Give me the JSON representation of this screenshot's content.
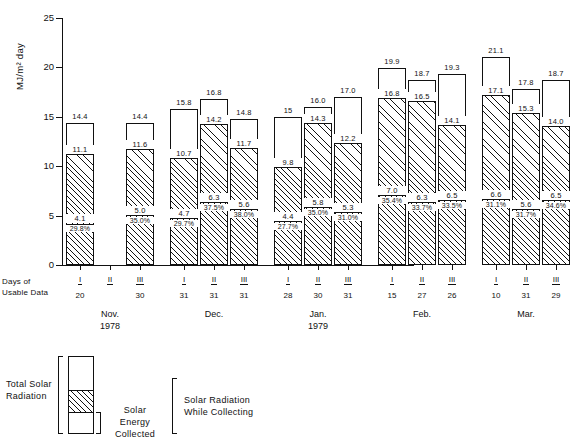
{
  "chart_data": {
    "type": "bar",
    "title": "",
    "xlabel": "",
    "ylabel": "MJ/m² day",
    "ylim": [
      0,
      25
    ],
    "yticks": [
      0,
      5,
      10,
      15,
      20,
      25
    ],
    "ytick_labels": [
      "0",
      "5",
      "10",
      "15",
      "20",
      "25"
    ],
    "grid": false,
    "legend_position": "below-left",
    "stack_note": "Each bar is stacked: dotted = Solar Energy Collected, hatched top edge = Solar Radiation While Collecting, full bar = Total Solar Radiation",
    "groups": [
      {
        "month": "Nov.",
        "year": "1978",
        "bars": [
          {
            "roman": "I",
            "days": "20",
            "total": 14.4,
            "collecting": 11.1,
            "collected": 4.1,
            "percent": "29.8%"
          },
          {
            "roman": "II",
            "days": "",
            "total": null,
            "collecting": null,
            "collected": null,
            "percent": ""
          },
          {
            "roman": "III",
            "days": "30",
            "total": 14.4,
            "collecting": 11.6,
            "collected": 5.0,
            "percent": "35.0%"
          }
        ]
      },
      {
        "month": "Dec.",
        "year": "",
        "bars": [
          {
            "roman": "I",
            "days": "31",
            "total": 15.8,
            "collecting": 10.7,
            "collected": 4.7,
            "percent": "29.7%"
          },
          {
            "roman": "II",
            "days": "31",
            "total": 16.8,
            "collecting": 14.2,
            "collected": 6.3,
            "percent": "37.5%"
          },
          {
            "roman": "III",
            "days": "31",
            "total": 14.8,
            "collecting": 11.7,
            "collected": 5.6,
            "percent": "38.0%"
          }
        ]
      },
      {
        "month": "Jan.",
        "year": "1979",
        "bars": [
          {
            "roman": "I",
            "days": "28",
            "total": 15.0,
            "collecting": 9.8,
            "collected": 4.4,
            "percent": "27.7%"
          },
          {
            "roman": "II",
            "days": "30",
            "total": 16.0,
            "collecting": 14.3,
            "collected": 5.8,
            "percent": "35.0%"
          },
          {
            "roman": "III",
            "days": "31",
            "total": 17.0,
            "collecting": 12.2,
            "collected": 5.3,
            "percent": "31.0%"
          }
        ]
      },
      {
        "month": "Feb.",
        "year": "",
        "bars": [
          {
            "roman": "I",
            "days": "15",
            "total": 19.9,
            "collecting": 16.8,
            "collected": 7.0,
            "percent": "35.4%"
          },
          {
            "roman": "II",
            "days": "27",
            "total": 18.7,
            "collecting": 16.5,
            "collected": 6.3,
            "percent": "33.7%"
          },
          {
            "roman": "III",
            "days": "26",
            "total": 19.3,
            "collecting": 14.1,
            "collected": 6.5,
            "percent": "33.5%"
          }
        ]
      },
      {
        "month": "Mar.",
        "year": "",
        "bars": [
          {
            "roman": "I",
            "days": "10",
            "total": 21.1,
            "collecting": 17.1,
            "collected": 6.6,
            "percent": "31.1%"
          },
          {
            "roman": "II",
            "days": "31",
            "total": 17.8,
            "collecting": 15.3,
            "collected": 5.6,
            "percent": "31.7%"
          },
          {
            "roman": "III",
            "days": "29",
            "total": 18.7,
            "collecting": 14.0,
            "collected": 6.5,
            "percent": "34.6%"
          }
        ]
      }
    ],
    "top_labels": [
      "14.4",
      "14.4",
      "15.8",
      "16.8",
      "14.8",
      "15",
      "16.0",
      "17.0",
      "19.9",
      "18.7",
      "19.3",
      "21.1",
      "17.8",
      "18.7"
    ],
    "mid_labels": [
      "11.1",
      "11.6",
      "10.7",
      "14.2",
      "11.7",
      "9.8",
      "14.3",
      "12.2",
      "16.8",
      "16.5",
      "14.1",
      "17.1",
      "15.3",
      "14.0"
    ],
    "low_labels": [
      "4.1",
      "5.0",
      "4.7",
      "6.3",
      "5.6",
      "4.4",
      "5.8",
      "5.3",
      "7.0",
      "6.3",
      "6.5",
      "6.6",
      "5.6",
      "6.5"
    ],
    "pct_labels": [
      "29.8%",
      "35.0%",
      "29.7%",
      "37.5%",
      "38.0%",
      "27.7%",
      "35.0%",
      "31.0%",
      "35.4%",
      "33.7%",
      "33.5%",
      "31.1%",
      "31.7%",
      "34.6%"
    ]
  },
  "axis": {
    "y_title": "MJ/m² day",
    "days_caption_line1": "Days  of",
    "days_caption_line2": "Usable  Data"
  },
  "legend": {
    "total_solar_radiation": "Total Solar\nRadiation",
    "total_line1": "Total Solar",
    "total_line2": "Radiation",
    "collected_line1": "Solar",
    "collected_line2": "Energy",
    "collected_line3": "Collected",
    "while_line1": "Solar Radiation",
    "while_line2": "While Collecting"
  }
}
